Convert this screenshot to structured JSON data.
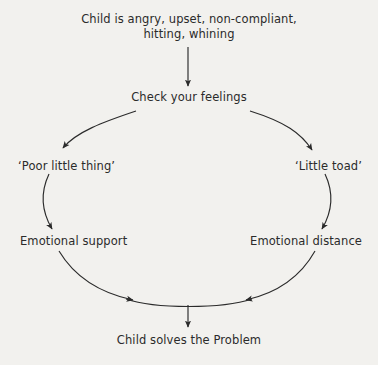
{
  "diagram": {
    "background_color": "#f2f1ee",
    "line_color": "#2b2b2b",
    "text_color": "#2b2b2b",
    "nodes": {
      "trigger": "Child is angry, upset, non-compliant,\nhitting, whining",
      "check": "Check your feelings",
      "poor_little_thing": "‘Poor little thing’",
      "little_toad": "‘Little toad’",
      "emotional_support": "Emotional support",
      "emotional_distance": "Emotional distance",
      "solves": "Child solves the Problem"
    },
    "connectors": [
      {
        "name": "trigger-to-check",
        "shape": "straight-vertical-arrow",
        "from": "trigger",
        "to": "check"
      },
      {
        "name": "check-to-poor-little-thing",
        "shape": "curved-arc-arrow",
        "from": "check",
        "to": "poor_little_thing"
      },
      {
        "name": "check-to-little-toad",
        "shape": "curved-arc-arrow",
        "from": "check",
        "to": "little_toad"
      },
      {
        "name": "poor-little-thing-to-emotional-support",
        "shape": "curved-arc-arrow",
        "from": "poor_little_thing",
        "to": "emotional_support"
      },
      {
        "name": "little-toad-to-emotional-distance",
        "shape": "curved-arc-arrow",
        "from": "little_toad",
        "to": "emotional_distance"
      },
      {
        "name": "emotional-support-to-bottom",
        "shape": "curved-arc-arrow",
        "from": "emotional_support",
        "to": "solves"
      },
      {
        "name": "emotional-distance-to-bottom",
        "shape": "curved-arc-arrow",
        "from": "emotional_distance",
        "to": "solves"
      },
      {
        "name": "bottom-to-solves",
        "shape": "straight-vertical-arrow",
        "from": "cycle_base",
        "to": "solves"
      }
    ]
  }
}
